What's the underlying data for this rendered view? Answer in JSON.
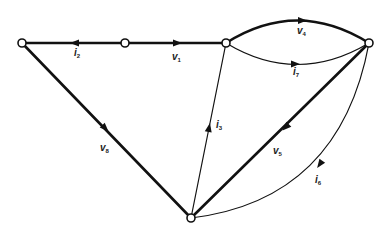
{
  "diagram": {
    "type": "network-graph",
    "colors": {
      "line": "#111111",
      "background": "#ffffff"
    },
    "nodes": [
      {
        "id": "A",
        "x": 22,
        "y": 43
      },
      {
        "id": "B",
        "x": 125,
        "y": 43
      },
      {
        "id": "C",
        "x": 226,
        "y": 43
      },
      {
        "id": "D",
        "x": 369,
        "y": 43
      },
      {
        "id": "E",
        "x": 191,
        "y": 218
      }
    ],
    "edges": [
      {
        "id": "e2",
        "from": "B",
        "to": "A",
        "label_base": "i",
        "label_sub": "2",
        "weight": "thick"
      },
      {
        "id": "e1",
        "from": "B",
        "to": "C",
        "label_base": "v",
        "label_sub": "1",
        "weight": "thick"
      },
      {
        "id": "e4",
        "from": "C",
        "to": "D",
        "label_base": "v",
        "label_sub": "4",
        "weight": "thick",
        "shape": "upper-arc"
      },
      {
        "id": "e7",
        "from": "C",
        "to": "D",
        "label_base": "i",
        "label_sub": "7",
        "weight": "thin",
        "shape": "lower-arc"
      },
      {
        "id": "e3",
        "from": "E",
        "to": "C",
        "label_base": "i",
        "label_sub": "3",
        "weight": "thin"
      },
      {
        "id": "e8",
        "from": "A",
        "to": "E",
        "label_base": "v",
        "label_sub": "8",
        "weight": "thick"
      },
      {
        "id": "e5",
        "from": "D",
        "to": "E",
        "label_base": "v",
        "label_sub": "5",
        "weight": "thick"
      },
      {
        "id": "e6",
        "from": "D",
        "to": "E",
        "label_base": "i",
        "label_sub": "6",
        "weight": "thin",
        "shape": "arc"
      }
    ]
  },
  "labels": {
    "i2": {
      "base": "i",
      "sub": "2"
    },
    "v1": {
      "base": "v",
      "sub": "1"
    },
    "v4": {
      "base": "v",
      "sub": "4"
    },
    "i7": {
      "base": "i",
      "sub": "7"
    },
    "i3": {
      "base": "i",
      "sub": "3"
    },
    "v8": {
      "base": "v",
      "sub": "8"
    },
    "v5": {
      "base": "v",
      "sub": "5"
    },
    "i6": {
      "base": "i",
      "sub": "6"
    }
  }
}
